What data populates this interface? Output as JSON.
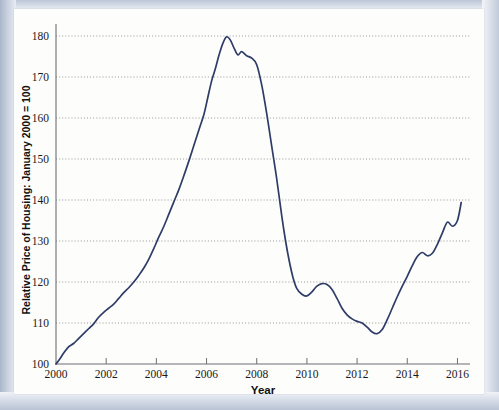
{
  "figure": {
    "background_color": "#fdfdfc",
    "scan_edge_color": "#c3ccdb"
  },
  "chart_data": {
    "type": "line",
    "title": "",
    "xlabel": "Year",
    "ylabel": "Relative Price of Housing: January 2000 = 100",
    "xlim": [
      2000,
      2016.5
    ],
    "ylim": [
      100,
      180
    ],
    "grid": true,
    "legend": null,
    "line_color": "#2e3c67",
    "x_ticks": [
      2000,
      2002,
      2004,
      2006,
      2008,
      2010,
      2012,
      2014,
      2016
    ],
    "x_tick_labels": [
      "2000",
      "2002",
      "2004",
      "2006",
      "2008",
      "2010",
      "2012",
      "2014",
      "2016"
    ],
    "y_ticks": [
      100,
      110,
      120,
      130,
      140,
      150,
      160,
      170,
      180
    ],
    "y_tick_labels": [
      "100",
      "110",
      "120",
      "130",
      "140",
      "150",
      "160",
      "170",
      "180"
    ],
    "series": [
      {
        "name": "Relative Price of Housing",
        "x": [
          2000.0,
          2000.15,
          2000.3,
          2000.5,
          2000.7,
          2000.9,
          2001.1,
          2001.3,
          2001.5,
          2001.7,
          2001.9,
          2002.1,
          2002.3,
          2002.5,
          2002.7,
          2002.9,
          2003.1,
          2003.3,
          2003.5,
          2003.7,
          2003.9,
          2004.1,
          2004.3,
          2004.5,
          2004.7,
          2004.9,
          2005.1,
          2005.3,
          2005.5,
          2005.7,
          2005.9,
          2006.05,
          2006.2,
          2006.35,
          2006.5,
          2006.65,
          2006.8,
          2006.95,
          2007.1,
          2007.25,
          2007.4,
          2007.6,
          2007.8,
          2008.0,
          2008.2,
          2008.4,
          2008.6,
          2008.8,
          2009.0,
          2009.15,
          2009.3,
          2009.45,
          2009.6,
          2009.8,
          2010.0,
          2010.2,
          2010.4,
          2010.6,
          2010.8,
          2011.0,
          2011.2,
          2011.4,
          2011.6,
          2011.8,
          2012.0,
          2012.2,
          2012.4,
          2012.6,
          2012.8,
          2013.0,
          2013.2,
          2013.4,
          2013.6,
          2013.8,
          2014.0,
          2014.2,
          2014.4,
          2014.6,
          2014.8,
          2015.0,
          2015.2,
          2015.4,
          2015.6,
          2015.8,
          2016.0,
          2016.15
        ],
        "values": [
          100.0,
          101.2,
          102.6,
          104.2,
          105.0,
          106.2,
          107.4,
          108.6,
          109.8,
          111.4,
          112.6,
          113.6,
          114.6,
          116.0,
          117.4,
          118.6,
          120.0,
          121.6,
          123.4,
          125.6,
          128.2,
          131.0,
          133.6,
          136.6,
          139.6,
          142.6,
          146.0,
          149.6,
          153.4,
          157.2,
          161.0,
          165.0,
          169.0,
          172.0,
          175.4,
          178.2,
          179.8,
          179.0,
          177.0,
          175.4,
          176.2,
          175.2,
          174.6,
          173.0,
          168.0,
          161.0,
          153.0,
          145.0,
          136.0,
          130.0,
          125.0,
          121.0,
          118.4,
          117.0,
          116.6,
          117.6,
          119.0,
          119.6,
          119.4,
          118.2,
          116.0,
          113.6,
          112.0,
          111.0,
          110.4,
          110.0,
          109.0,
          107.8,
          107.4,
          108.4,
          110.8,
          113.6,
          116.4,
          119.0,
          121.4,
          124.0,
          126.2,
          127.2,
          126.4,
          127.0,
          129.2,
          132.0,
          134.6,
          133.6,
          135.0,
          139.4
        ]
      }
    ]
  }
}
